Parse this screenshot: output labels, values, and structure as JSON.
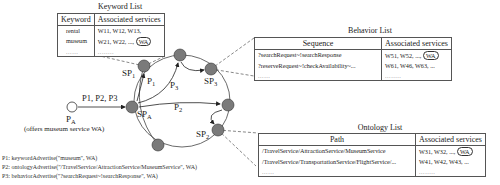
{
  "keyword_list": {
    "title": "Keyword List",
    "headers": [
      "Keyword",
      "Associated services"
    ],
    "rows": [
      {
        "keyword": "rental",
        "services": "W11, W12, W13,",
        "wa": ""
      },
      {
        "keyword": "museum",
        "services": "W21, W22, ...,",
        "wa": "WA"
      },
      {
        "keyword": "......",
        "services": "........",
        "wa": ""
      }
    ]
  },
  "behavior_list": {
    "title": "Behavior List",
    "headers": [
      "Sequence",
      "Associated services"
    ],
    "rows": [
      {
        "sequence": "?searchRequest~!searchResponse",
        "services": "W51, W52, ...,",
        "wa": "WA"
      },
      {
        "sequence": "?reserveRequest~!checkAvailability~...",
        "services": "W61, W46, W63, ...",
        "wa": ""
      },
      {
        "sequence": "......",
        "services": "........",
        "wa": ""
      }
    ]
  },
  "ontology_list": {
    "title": "Ontology List",
    "headers": [
      "Path",
      "Associated services"
    ],
    "rows": [
      {
        "path": "/TravelService/AttractionService/MuseumService",
        "services": "W31, W32, ...,",
        "wa": "WA"
      },
      {
        "path": "/TravelService/TransportationService/FlightService/...",
        "services": "W41, W42, W43, ...",
        "wa": ""
      },
      {
        "path": "......",
        "services": "........",
        "wa": ""
      }
    ]
  },
  "nodes": {
    "sp1": {
      "label": "SP",
      "sub": "1"
    },
    "sp3": {
      "label": "SP",
      "sub": "3"
    },
    "spa": {
      "label": "SP",
      "sub": "A"
    },
    "sp2": {
      "label": "SP",
      "sub": "2"
    },
    "pa": {
      "label": "P",
      "sub": "A",
      "caption": "(offers museum service WA)"
    }
  },
  "edges": {
    "pa_to_spa": "P1, P2, P3",
    "p1": {
      "label": "P",
      "sub": "1"
    },
    "p2": {
      "label": "P",
      "sub": "2"
    },
    "p3": {
      "label": "P",
      "sub": "3"
    }
  },
  "legend": [
    "P1: keywordAdvertise(\"museum\", WA)",
    "P2: ontologyAdvertise(\"/TravelService/AttractionService/MuseumService\", WA)",
    "P3: behaviorAdvertise(\"?searchRequest~!searchResponse\", WA)"
  ],
  "colors": {
    "node_fill": "#7a7a7a",
    "line": "#333333",
    "dash": "#555555"
  }
}
